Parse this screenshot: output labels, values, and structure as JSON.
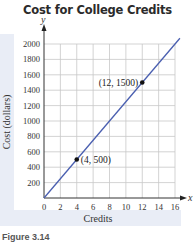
{
  "chart_data": {
    "type": "line",
    "title": "Cost for College Credits",
    "xlabel": "Credits",
    "ylabel": "Cost (dollars)",
    "x_axis_symbol": "x",
    "y_axis_symbol": "y",
    "x_ticks": [
      0,
      2,
      4,
      6,
      8,
      10,
      12,
      14,
      16
    ],
    "y_ticks": [
      200,
      400,
      600,
      800,
      1000,
      1200,
      1400,
      1600,
      1800,
      2000
    ],
    "xlim": [
      0,
      16
    ],
    "ylim": [
      0,
      2000
    ],
    "grid": true,
    "series": [
      {
        "name": "Cost",
        "x": [
          0,
          4,
          12,
          16
        ],
        "y": [
          0,
          500,
          1500,
          2000
        ],
        "color": "#4a5fb0"
      }
    ],
    "points": [
      {
        "x": 4,
        "y": 500,
        "label": "(4, 500)"
      },
      {
        "x": 12,
        "y": 1500,
        "label": "(12, 1500)"
      }
    ],
    "caption": "Figure 3.14"
  }
}
